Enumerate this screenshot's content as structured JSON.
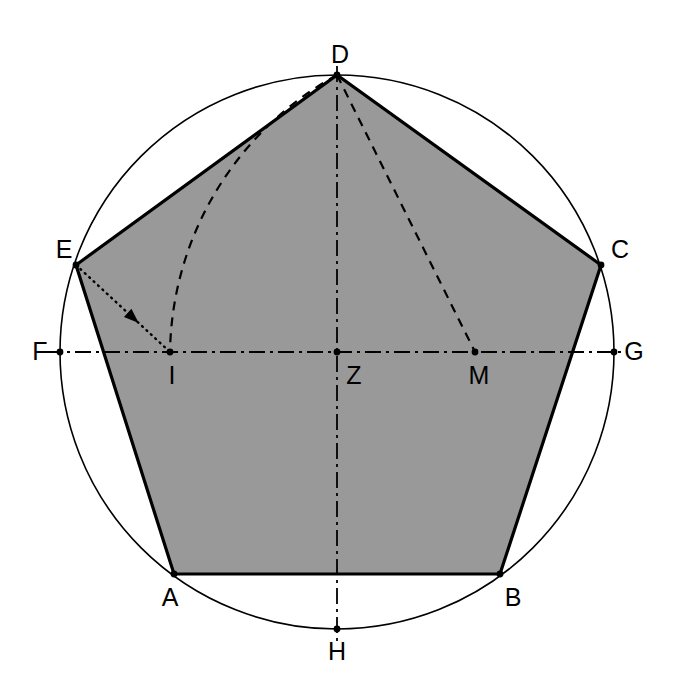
{
  "figure": {
    "kind": "geometric-construction",
    "background_color": "#ffffff",
    "polygon_fill_color": "#999999",
    "stroke_color": "#000000",
    "circle_stroke_color": "#000000"
  },
  "canvas": {
    "width": 675,
    "height": 676
  },
  "circle": {
    "name": "circumscribed-circle",
    "center_x": 337,
    "center_y": 352,
    "radius": 277,
    "stroke_width": 1.6
  },
  "points": [
    {
      "id": "A",
      "label": "A",
      "x": 174,
      "y": 574,
      "label_x": 170,
      "label_y": 597,
      "on_circle": true,
      "marker": true
    },
    {
      "id": "B",
      "label": "B",
      "x": 500,
      "y": 574,
      "label_x": 513,
      "label_y": 597,
      "on_circle": true,
      "marker": true
    },
    {
      "id": "C",
      "label": "C",
      "x": 601,
      "y": 265,
      "label_x": 620,
      "label_y": 249,
      "on_circle": true,
      "marker": true
    },
    {
      "id": "D",
      "label": "D",
      "x": 337,
      "y": 75,
      "label_x": 340,
      "label_y": 54,
      "on_circle": true,
      "marker": true
    },
    {
      "id": "E",
      "label": "E",
      "x": 76,
      "y": 265,
      "label_x": 64,
      "label_y": 249,
      "on_circle": true,
      "marker": true
    },
    {
      "id": "F",
      "label": "F",
      "x": 60,
      "y": 352,
      "label_x": 40,
      "label_y": 351,
      "on_circle": true,
      "marker": true
    },
    {
      "id": "G",
      "label": "G",
      "x": 614,
      "y": 352,
      "label_x": 634,
      "label_y": 351,
      "on_circle": true,
      "marker": true
    },
    {
      "id": "H",
      "label": "H",
      "x": 337,
      "y": 629,
      "label_x": 337,
      "label_y": 651,
      "on_circle": true,
      "marker": true
    },
    {
      "id": "I",
      "label": "I",
      "x": 170,
      "y": 352,
      "label_x": 172,
      "label_y": 375,
      "on_circle": false,
      "marker": true
    },
    {
      "id": "M",
      "label": "M",
      "x": 475,
      "y": 352,
      "label_x": 479,
      "label_y": 375,
      "on_circle": false,
      "marker": true
    },
    {
      "id": "Z",
      "label": "Z",
      "x": 337,
      "y": 352,
      "label_x": 354,
      "label_y": 375,
      "on_circle": false,
      "marker": true
    }
  ],
  "pentagon": {
    "name": "pentagon-ABCDE",
    "vertex_order": [
      "A",
      "B",
      "C",
      "D",
      "E"
    ],
    "points_attr": "174,574 500,574 601,265 337,75 76,265",
    "fill": "#999999",
    "stroke": "#000000",
    "stroke_width": 3.2
  },
  "axes": [
    {
      "id": "FG",
      "name": "horizontal-axis-FG",
      "from": "F",
      "to": "G",
      "x1": 46,
      "y1": 352,
      "x2": 628,
      "y2": 352,
      "style": "dash-dot",
      "stroke_width": 1.8
    },
    {
      "id": "DH",
      "name": "vertical-axis-DH",
      "from": "D",
      "to": "H",
      "x1": 337,
      "y1": 66,
      "x2": 337,
      "y2": 643,
      "style": "dash-dot",
      "stroke_width": 1.8
    }
  ],
  "construction_lines": [
    {
      "id": "DM",
      "name": "dashed-segment-D-M",
      "x1": 337,
      "y1": 75,
      "x2": 475,
      "y2": 352,
      "style": "dashed",
      "stroke_width": 2.2
    },
    {
      "id": "EI",
      "name": "dotted-segment-E-I",
      "x1": 76,
      "y1": 265,
      "x2": 170,
      "y2": 352,
      "style": "dotted",
      "stroke_width": 2.4,
      "arrow": {
        "present": true,
        "at_fraction": 0.55,
        "points_toward": "I"
      }
    }
  ],
  "construction_arcs": [
    {
      "id": "arc-D-I",
      "name": "dashed-arc-D-to-I",
      "center": "E",
      "center_x": 76,
      "center_y": 265,
      "radius": 322,
      "start_x": 337,
      "start_y": 75,
      "end_x": 170,
      "end_y": 352,
      "sweep_flag": 0,
      "large_arc_flag": 0,
      "style": "dashed",
      "stroke_width": 2.2
    }
  ],
  "labels": {
    "font_size_px": 25,
    "color": "#000000"
  }
}
